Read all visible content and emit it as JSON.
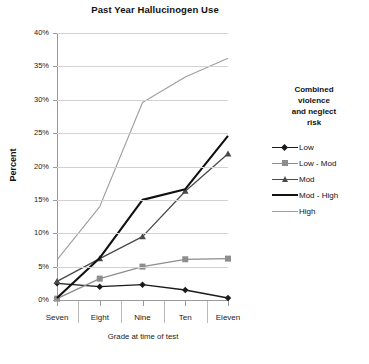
{
  "chart_data": {
    "type": "line",
    "title": "Past Year Hallucinogen Use",
    "xlabel": "Grade at time of test",
    "ylabel": "Percent",
    "categories": [
      "Seven",
      "Eight",
      "Nine",
      "Ten",
      "Eleven"
    ],
    "ylim": [
      0,
      40
    ],
    "ytick_labels": [
      "0%",
      "5%",
      "10%",
      "15%",
      "20%",
      "25%",
      "30%",
      "35%",
      "40%"
    ],
    "ytick_values": [
      0,
      5,
      10,
      15,
      20,
      25,
      30,
      35,
      40
    ],
    "grid": true,
    "legend_position": "right",
    "legend_title": "Combined violence and neglect risk",
    "series": [
      {
        "name": "Low",
        "values": [
          2.5,
          2.0,
          2.3,
          1.5,
          0.3
        ],
        "color": "#1a1a1a",
        "marker": "diamond",
        "width": 1.3
      },
      {
        "name": "Low - Mod",
        "values": [
          0.2,
          3.2,
          5.0,
          6.1,
          6.2
        ],
        "color": "#8d8d8d",
        "marker": "square",
        "width": 1.3
      },
      {
        "name": "Mod",
        "values": [
          2.8,
          6.2,
          9.5,
          16.3,
          21.9
        ],
        "color": "#4a4a4a",
        "marker": "triangle",
        "width": 1.3
      },
      {
        "name": "Mod - High",
        "values": [
          0.3,
          6.3,
          15.0,
          16.6,
          24.6
        ],
        "color": "#111111",
        "marker": "none",
        "width": 2.1
      },
      {
        "name": "High",
        "values": [
          6.0,
          14.0,
          29.6,
          33.4,
          36.2
        ],
        "color": "#9e9e9e",
        "marker": "none",
        "width": 1.1
      }
    ]
  },
  "legend": {
    "title_lines": [
      "Combined",
      "violence",
      "and neglect",
      "risk"
    ],
    "entries": [
      {
        "label": "Low"
      },
      {
        "label": "Low - Mod"
      },
      {
        "label": "Mod"
      },
      {
        "label": "Mod - High"
      },
      {
        "label": "High"
      }
    ]
  },
  "colors": {
    "background": "#ffffff",
    "axis": "#9a9a9a",
    "grid": "#d2d2d2",
    "text": "#1a1a1a"
  }
}
